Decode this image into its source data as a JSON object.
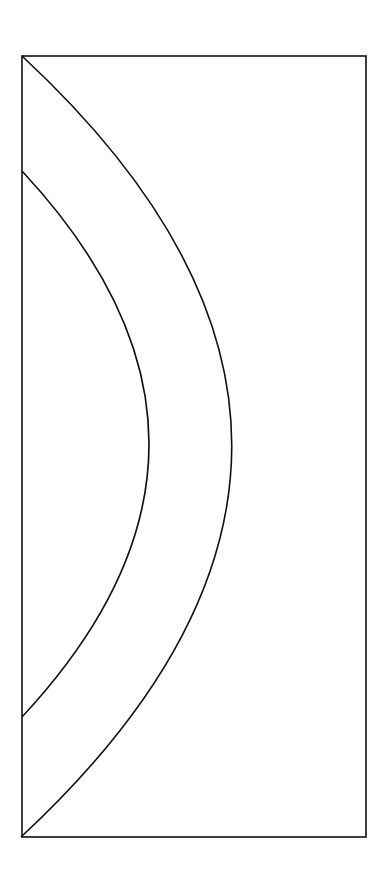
{
  "diagram": {
    "background": "#ffffff",
    "stroke_color": "#111111",
    "frame": {
      "x": 22,
      "y": 56,
      "width": 344,
      "height": 781
    },
    "outer_arc": {
      "start": [
        22,
        56
      ],
      "control": [
        442,
        446
      ],
      "end": [
        21,
        837
      ]
    },
    "inner_arc": {
      "start": [
        22,
        171
      ],
      "control": [
        276,
        444
      ],
      "end": [
        22,
        717
      ]
    }
  }
}
